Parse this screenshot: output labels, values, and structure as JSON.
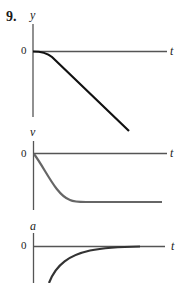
{
  "problem_number": "9.",
  "graphs": [
    {
      "id": "position",
      "y_label": "y",
      "x_label": "t",
      "zero_label": "0",
      "description": "y starts at 0 with zero slope, curves downward, then decreases linearly"
    },
    {
      "id": "velocity",
      "y_label": "v",
      "x_label": "t",
      "zero_label": "0",
      "description": "v starts at 0, decreases rapidly, then levels off at a constant negative value"
    },
    {
      "id": "acceleration",
      "y_label": "a",
      "x_label": "t",
      "zero_label": "0",
      "description": "a starts large negative and approaches 0 asymptotically"
    }
  ],
  "colors": {
    "axis": "#555555",
    "curve_dark": "#111111",
    "curve_gray": "#666666",
    "curve_a": "#333333"
  }
}
